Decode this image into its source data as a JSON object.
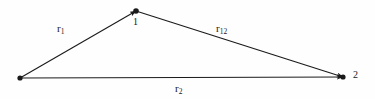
{
  "figure": {
    "name": "vector-triangle-diagram",
    "width": 375,
    "height": 99,
    "background_color": "#fefefe",
    "stroke_color": "#1a1a1a",
    "labels": {
      "r1_base": "r",
      "r1_sub": "1",
      "r12_base": "r",
      "r12_sub": "12",
      "r2_base": "r",
      "r2_sub": "2",
      "vertex_1": "1",
      "vertex_2": "2"
    },
    "geometry": {
      "origin": {
        "x": 20,
        "y": 78
      },
      "vertex_1": {
        "x": 136,
        "y": 11
      },
      "vertex_2": {
        "x": 343,
        "y": 77
      }
    },
    "vectors": [
      {
        "name": "r1",
        "from": "origin",
        "to": "vertex_1",
        "arrowhead": "at-head"
      },
      {
        "name": "r12",
        "from": "vertex_1",
        "to": "vertex_2",
        "arrowhead": "at-head"
      },
      {
        "name": "r2",
        "from": "origin",
        "to": "vertex_2",
        "arrowhead": "at-head"
      }
    ]
  }
}
